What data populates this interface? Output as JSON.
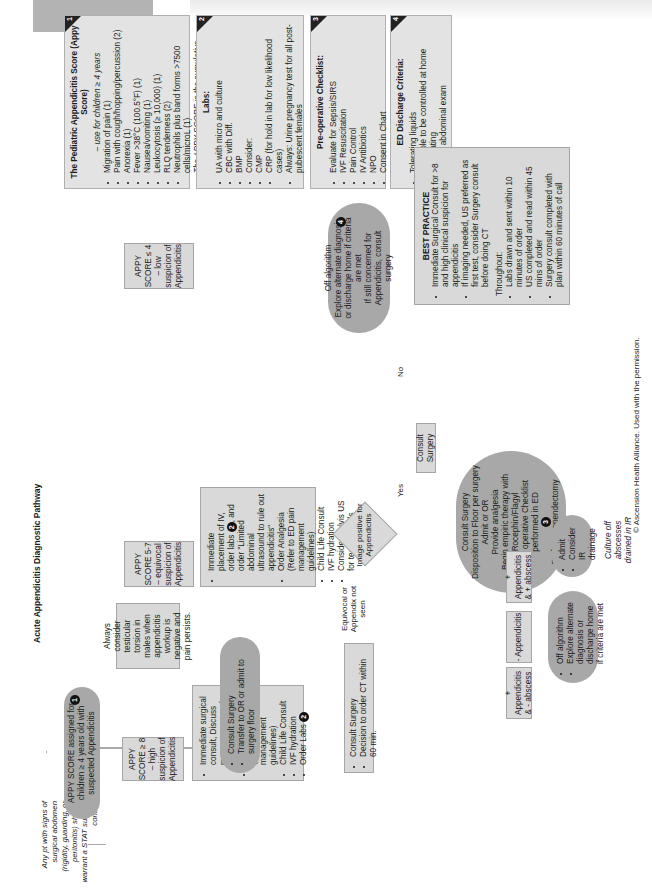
{
  "page": {
    "title": "Acute Appendicitis Diagnostic Pathway",
    "copyright": "© Ascension Health Alliance. Used with the permission."
  },
  "note_stat": "Any pt with signs of surgical abdomen (rigidity, guarding, or peritonitis) should warrant a STAT surgery consult",
  "start": {
    "text": "APPY SCORE assigned for children ≥ 4 years old with suspected Appendicitis",
    "ref": "1"
  },
  "branches": {
    "high": "APPY SCORE ≥ 8 – high suspicion of Appendicitis",
    "equivocal": "APPY SCORE 5-7 – equivocal suspicion of Appendicitis",
    "low": "APPY SCORE ≤ 4 – low suspicion of Appendicitis"
  },
  "high_actions": {
    "items": [
      "Immediate surgical consult, Discuss management and imaging plan",
      "Order analgesia (Refer to ED pain management guidelines)",
      "Child Life Consult",
      "IVF hydration",
      "Order Labs"
    ],
    "labs_ref": "2"
  },
  "high_outcome": {
    "items": [
      "Consult Surgery",
      "Transfer to OR or admit to surgery floor"
    ]
  },
  "torsion_note": "Always consider testicular torsion in males when appendicitis workup is negative and pain persists.",
  "equivocal_actions": {
    "items": [
      "Immediate placement of IV, order labs",
      ", and order \"Limited abdominal ultrasound to rule out appendicitis\"",
      "Order Analgesia (Refer to ED pain management guidelines)",
      "Child Life Consult",
      "IVF hydration",
      "Consider Pelvis US for teenage girls"
    ],
    "labs_ref": "2"
  },
  "decision": {
    "text": "Image positive for Appendicitis",
    "yes_label": "Yes",
    "no_label": "No",
    "equivocal_label": "Equivocal or Appendix not seen"
  },
  "ct_box": {
    "items": [
      "Consult Surgery",
      "Decision to order CT within 60 min."
    ]
  },
  "consult_surgery": "Consult Surgery",
  "ct_results": {
    "pos_no_abscess": "+ Appendicitis & - abscess",
    "negative": "- Appendicitis",
    "pos_abscess": "+ Appendicitis & + abscess"
  },
  "ct_negative_outcome": {
    "items": [
      "Off algorithm",
      "Explore alternate diagnosis or discharge home if criteria are met"
    ]
  },
  "abscess_outcome": {
    "items": [
      "Admit",
      "Consider IR drainage"
    ]
  },
  "abscess_note": "Culture off abscesses drained in IR",
  "surgery_oval": {
    "items": [
      "Consult Surgery",
      "Disposition to Floor per surgery",
      "Admit or OR",
      "Provide analgesia",
      "Begin empiric therapy with Rocephin/Flagyl",
      "Pre operative Checklist performed in ED",
      "Perform appendectomy"
    ],
    "ref": "3"
  },
  "low_outcome": {
    "line1": "Off algorithm",
    "line2": "Explore alternate diagnosis or discharge home if criteria are met",
    "line3": "If still concerned for Appendicitis, consult surgery",
    "ref": "4"
  },
  "best_practice": {
    "title": "BEST PRACTICE",
    "items": [
      "Immediate Surgical Consult for >8 and high clinical suspicion for appendicitis",
      "If imaging needed, US preferred as first test, consider Surgery consult before doing CT"
    ],
    "throughout_label": "Throughout:",
    "throughout_items": [
      "Labs drawn and sent within 10 minutes of order",
      "US completed and read within 45 mins of order",
      "Surgery consult completed with plan within 60 minutes of call"
    ]
  },
  "info_boxes": [
    {
      "number": "1",
      "title": "The Pediatric Appendicitis Score (Appy Score)",
      "subtitle": "– use for children ≥ 4 years",
      "items": [
        "Migration of pain (1)",
        "Pain with cough/hopping/percussion (2)",
        "Anorexia (1)",
        "Fever >38°C (100.5°F) (1)",
        "Nausea/vomiting (1)",
        "Leukocytosis (≥ 10,000) (1)",
        "RLQ tenderness (2)",
        "Neutrophils plus band forms >7500 cells/microL (1)"
      ],
      "footnote": "The APPY SCORE is the cumulative point total from clinical findings."
    },
    {
      "number": "2",
      "title": "Labs:",
      "items": [
        "UA with micro and culture",
        "CBC with Diff.",
        "BMP",
        "Consider:",
        "CMP",
        "CRP (for hold in lab for low likelihood cases)",
        "Always: Urine pregnancy test for all post-pubescent females"
      ]
    },
    {
      "number": "3",
      "title": "Pre-operative Checklist:",
      "items": [
        "Evaluate for Sepsis/SIRS",
        "IVF Resuscitation",
        "Pain Control",
        "IV Antibiotics",
        "NPO",
        "Consent in Chart"
      ]
    },
    {
      "number": "4",
      "title": "ED Discharge Criteria:",
      "items": [
        "Tolerating liquids",
        "Pain able to be controlled at home",
        "Ambulating",
        "Benign abdominal exam"
      ]
    }
  ],
  "colors": {
    "box_fill": "#d9d9d9",
    "pill_fill": "#a8a8a8",
    "connector": "#a9a9a9",
    "badge": "#111111"
  }
}
